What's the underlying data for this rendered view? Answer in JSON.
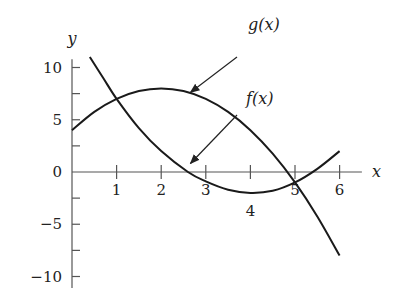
{
  "chart_data": {
    "type": "line",
    "title": "",
    "xlabel": "x",
    "ylabel": "y",
    "xlim": [
      0,
      6.5
    ],
    "ylim": [
      -11,
      11
    ],
    "grid": false,
    "x_ticks": [
      1,
      2,
      3,
      4,
      5,
      6
    ],
    "x_tick_labels": [
      "1",
      "2",
      "3",
      "4",
      "5",
      "6"
    ],
    "y_ticks": [
      10,
      7.5,
      5,
      2.5,
      0,
      -2.5,
      -5,
      -7.5,
      -10
    ],
    "y_tick_labels": [
      {
        "value": 10,
        "label": "10"
      },
      {
        "value": 5,
        "label": "5"
      },
      {
        "value": 0,
        "label": "0"
      },
      {
        "value": -5,
        "label": "−5"
      },
      {
        "value": -10,
        "label": "−10"
      }
    ],
    "series": [
      {
        "name": "f(x)",
        "x": [
          0.4,
          0.7,
          1.0,
          1.5,
          2.0,
          2.6,
          3.0,
          3.5,
          4.0,
          4.5,
          5.0,
          5.5,
          6.0
        ],
        "values": [
          11,
          9,
          7,
          4.2,
          2,
          0,
          -0.9,
          -1.7,
          -2,
          -1.8,
          -1,
          0.3,
          2
        ]
      },
      {
        "name": "g(x)",
        "x": [
          0,
          0.5,
          1.0,
          1.5,
          2.0,
          2.5,
          3.0,
          3.5,
          4.0,
          4.5,
          5.0,
          5.5,
          6.0
        ],
        "values": [
          4,
          5.75,
          7,
          7.75,
          8,
          7.75,
          7,
          5.75,
          4,
          1.75,
          -1,
          -4.25,
          -8
        ]
      }
    ],
    "annotations": [
      {
        "text": "g(x)",
        "arrow_to": {
          "x": 2.7,
          "y": 8
        }
      },
      {
        "text": "f(x)",
        "arrow_to": {
          "x": 2.7,
          "y": 1.2
        }
      }
    ],
    "colors": {
      "line": "#1a1a1a",
      "axis": "#555555"
    }
  }
}
